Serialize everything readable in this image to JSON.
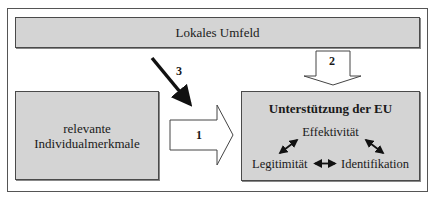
{
  "diagram": {
    "top_bar": {
      "label": "Lokales Umfeld"
    },
    "left_box": {
      "line1": "relevante",
      "line2": "Individualmerkmale"
    },
    "right_box": {
      "title": "Unterstützung der EU",
      "components": {
        "top": "Effektivität",
        "left": "Legitimität",
        "right": "Identifikation"
      }
    },
    "arrows": {
      "arrow_1": {
        "label": "1",
        "from": "relevante Individualmerkmale",
        "to": "Unterstützung der EU",
        "style": "block-outline"
      },
      "arrow_2": {
        "label": "2",
        "from": "Lokales Umfeld",
        "to": "Unterstützung der EU",
        "style": "block-outline"
      },
      "arrow_3": {
        "label": "3",
        "from": "Lokales Umfeld",
        "to": "arrow 1",
        "style": "thick-line"
      }
    },
    "relations": [
      {
        "between": [
          "Effektivität",
          "Legitimität"
        ],
        "type": "bidirectional"
      },
      {
        "between": [
          "Effektivität",
          "Identifikation"
        ],
        "type": "bidirectional"
      },
      {
        "between": [
          "Legitimität",
          "Identifikation"
        ],
        "type": "bidirectional"
      }
    ],
    "colors": {
      "box_fill": "#d4d4d4",
      "border": "#4a4a4a",
      "arrow_fill": "#ffffff",
      "line": "#111111"
    }
  }
}
